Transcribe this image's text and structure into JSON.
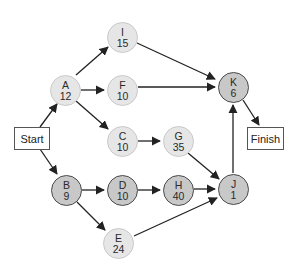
{
  "diagram": {
    "type": "activity-on-node network",
    "start_label": "Start",
    "finish_label": "Finish",
    "colors": {
      "critical_fill": "#c8c8c8",
      "critical_border": "#4a4a4a",
      "noncritical_fill": "#e6e6e6",
      "noncritical_border": "#c9c9c9",
      "edge": "#222222"
    },
    "nodes": {
      "A": {
        "id": "A",
        "duration": "12",
        "critical": false
      },
      "B": {
        "id": "B",
        "duration": "9",
        "critical": true
      },
      "C": {
        "id": "C",
        "duration": "10",
        "critical": false
      },
      "D": {
        "id": "D",
        "duration": "10",
        "critical": true
      },
      "E": {
        "id": "E",
        "duration": "24",
        "critical": false
      },
      "F": {
        "id": "F",
        "duration": "10",
        "critical": false
      },
      "G": {
        "id": "G",
        "duration": "35",
        "critical": false
      },
      "H": {
        "id": "H",
        "duration": "40",
        "critical": true
      },
      "I": {
        "id": "I",
        "duration": "15",
        "critical": false
      },
      "J": {
        "id": "J",
        "duration": "1",
        "critical": true
      },
      "K": {
        "id": "K",
        "duration": "6",
        "critical": true
      }
    },
    "edges": [
      [
        "Start",
        "A"
      ],
      [
        "Start",
        "B"
      ],
      [
        "A",
        "I"
      ],
      [
        "A",
        "F"
      ],
      [
        "A",
        "C"
      ],
      [
        "B",
        "D"
      ],
      [
        "B",
        "E"
      ],
      [
        "C",
        "G"
      ],
      [
        "D",
        "H"
      ],
      [
        "G",
        "J"
      ],
      [
        "H",
        "J"
      ],
      [
        "E",
        "J"
      ],
      [
        "I",
        "K"
      ],
      [
        "F",
        "K"
      ],
      [
        "J",
        "K"
      ],
      [
        "K",
        "Finish"
      ]
    ]
  }
}
